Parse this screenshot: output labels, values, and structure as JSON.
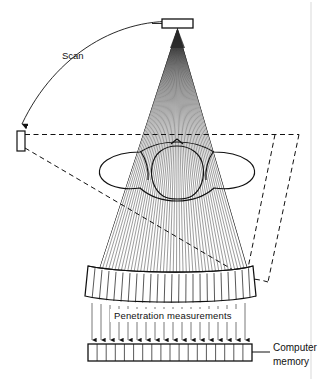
{
  "figure": {
    "domain_kind": "diagram",
    "background_color": "#ffffff",
    "ink_color": "#111111",
    "page_edge_color": "#d9d9d9"
  },
  "labels": {
    "scan": "Scan",
    "penetration": "Penetration measurements",
    "computer_memory_line1": "Computer",
    "computer_memory_line2": "memory"
  },
  "components": {
    "xray_source": {
      "name": "x-ray-source",
      "shape": "rectangle",
      "x": 162,
      "y": 19,
      "width": 31,
      "height": 9
    },
    "source_rotated": {
      "name": "x-ray-source-rotated-position",
      "shape": "rectangle",
      "x": 17,
      "y": 131,
      "width": 8,
      "height": 20
    },
    "detector_array": {
      "name": "detector-array",
      "shape": "curved-band",
      "segments": 24,
      "left_x": 88,
      "right_x": 253,
      "top_y": 266,
      "bottom_y": 297
    },
    "detector_rotated": {
      "name": "detector-array-rotated-position",
      "shape": "dashed-band",
      "style": "dashed"
    },
    "memory_array": {
      "name": "computer-memory-array",
      "shape": "rectangle-with-cells",
      "cells": 18,
      "x": 88,
      "y": 344,
      "width": 164,
      "height": 17
    },
    "patient": {
      "name": "patient-cross-section",
      "description": "transverse body outline with arms and internal organ contour"
    },
    "scan_arc": {
      "name": "scan-rotation-arc",
      "has_arrowhead": true,
      "arrow_direction": "down"
    },
    "fan_beam": {
      "name": "fan-beam-rays",
      "ray_count_dense": 46,
      "ray_count_visible_lower": 22,
      "apex_x": 177.5,
      "apex_y": 28
    },
    "measurement_arrows": {
      "name": "penetration-measurement-arrows",
      "count": 18,
      "direction": "down"
    },
    "leader_line": {
      "name": "computer-memory-leader-line",
      "from_x": 252,
      "to_x": 268,
      "y": 352
    }
  },
  "geometry": {
    "canvas_width": 329,
    "canvas_height": 381,
    "page_edge_x": 311
  }
}
